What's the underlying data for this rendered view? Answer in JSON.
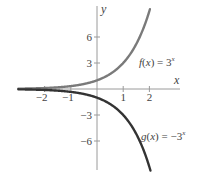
{
  "chart_data": {
    "type": "line",
    "title": "",
    "xlabel": "x",
    "ylabel": "y",
    "xlim": [
      -3,
      3
    ],
    "ylim": [
      -9.5,
      9.5
    ],
    "x_ticks": [
      -2,
      -1,
      1,
      2
    ],
    "x_tick_labels": [
      "−2",
      "−1",
      "1",
      "2"
    ],
    "y_ticks": [
      6,
      3,
      -3,
      -6
    ],
    "y_tick_labels": [
      "6",
      "3",
      "−3",
      "−6"
    ],
    "grid": false,
    "legend": "inline annotations",
    "series": [
      {
        "name": "f(x) = 3^x",
        "label": "f(x) = 3",
        "label_exp": "x",
        "color": "#7a7a7a",
        "x": [
          -3,
          -2,
          -1,
          0,
          1,
          2
        ],
        "values": [
          0.037,
          0.111,
          0.333,
          1,
          3,
          9
        ]
      },
      {
        "name": "g(x) = -3^x",
        "label": "g(x) = −3",
        "label_exp": "x",
        "color": "#333333",
        "x": [
          -3,
          -2,
          -1,
          0,
          1,
          2
        ],
        "values": [
          -0.037,
          -0.111,
          -0.333,
          -1,
          -3,
          -9
        ]
      }
    ]
  },
  "axes": {
    "x_label": "x",
    "y_label": "y"
  }
}
